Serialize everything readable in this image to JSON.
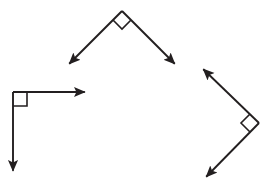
{
  "canvas": {
    "width": 269,
    "height": 186,
    "background": "#ffffff",
    "stroke_color": "#231f20",
    "stroke_width": 1.9
  },
  "chart_data": {
    "type": "diagram",
    "title": "",
    "subtitle": "",
    "figure_count": 3,
    "figures": [
      {
        "id": "top-angle",
        "name": "downward-opening-right-angle",
        "vertex": {
          "x": 122,
          "y": 11
        },
        "angle_degrees": 90,
        "marker": {
          "type": "square",
          "shape": "diamond",
          "size": 13,
          "points": "122,11 131,20 122,29 113,20"
        },
        "rays": [
          {
            "name": "ray-down-left",
            "from": {
              "x": 122,
              "y": 11
            },
            "to": {
              "x": 67,
              "y": 66
            },
            "direction_degrees": 225,
            "arrow": true
          },
          {
            "name": "ray-down-right",
            "from": {
              "x": 122,
              "y": 11
            },
            "to": {
              "x": 177,
              "y": 66
            },
            "direction_degrees": 315,
            "arrow": true
          }
        ]
      },
      {
        "id": "left-angle",
        "name": "right-angle-opening-down-right",
        "vertex": {
          "x": 13,
          "y": 92
        },
        "angle_degrees": 90,
        "marker": {
          "type": "square",
          "shape": "axis-aligned",
          "size": 14,
          "points": "13,106 27,106 27,92"
        },
        "rays": [
          {
            "name": "ray-right",
            "from": {
              "x": 13,
              "y": 92
            },
            "to": {
              "x": 88,
              "y": 92
            },
            "direction_degrees": 0,
            "arrow": true
          },
          {
            "name": "ray-down",
            "from": {
              "x": 13,
              "y": 92
            },
            "to": {
              "x": 13,
              "y": 174
            },
            "direction_degrees": 270,
            "arrow": true
          }
        ]
      },
      {
        "id": "right-angle-figure",
        "name": "leftward-opening-right-angle",
        "vertex": {
          "x": 259,
          "y": 123
        },
        "angle_degrees": 90,
        "marker": {
          "type": "square",
          "shape": "diamond",
          "size": 13,
          "points": "259,123 250,114 241,123 250,132"
        },
        "rays": [
          {
            "name": "ray-up-left",
            "from": {
              "x": 259,
              "y": 123
            },
            "to": {
              "x": 201,
              "y": 67
            },
            "direction_degrees": 136,
            "arrow": true
          },
          {
            "name": "ray-down-left",
            "from": {
              "x": 259,
              "y": 123
            },
            "to": {
              "x": 204,
              "y": 179
            },
            "direction_degrees": 225,
            "arrow": true
          }
        ]
      }
    ],
    "labels": [],
    "legend": [],
    "annotations": []
  }
}
